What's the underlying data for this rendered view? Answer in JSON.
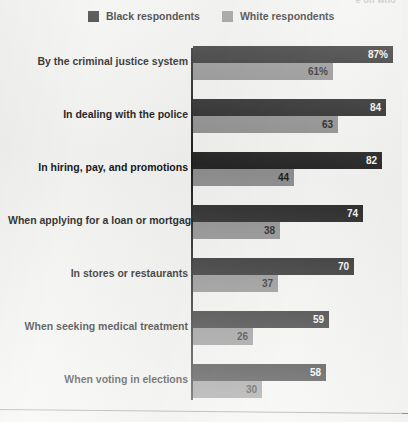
{
  "headline_fragment": "e on who",
  "legend": {
    "entries": [
      {
        "label": "Black respondents",
        "color": "#262626",
        "swatch": "legend-swatch-black"
      },
      {
        "label": "White respondents",
        "color": "#8e8e8e",
        "swatch": "legend-swatch-white"
      }
    ]
  },
  "chart_data": {
    "type": "bar",
    "orientation": "horizontal",
    "title": "",
    "subtitle": "",
    "xlabel": "",
    "ylabel": "",
    "xlim": [
      0,
      87
    ],
    "grid": false,
    "legend_position": "top",
    "value_suffix_first_row_only": "%",
    "categories": [
      "By the criminal justice system",
      "In dealing with the police",
      "In hiring, pay, and promotions",
      "When applying for a loan or mortgage",
      "In stores or restaurants",
      "When seeking medical treatment",
      "When voting in elections"
    ],
    "series": [
      {
        "name": "Black respondents",
        "color": "#262626",
        "values": [
          87,
          84,
          82,
          74,
          70,
          59,
          58
        ],
        "labels": [
          "87%",
          "84",
          "82",
          "74",
          "70",
          "59",
          "58"
        ]
      },
      {
        "name": "White respondents",
        "color": "#8e8e8e",
        "values": [
          61,
          63,
          44,
          38,
          37,
          26,
          30
        ],
        "labels": [
          "61%",
          "63",
          "44",
          "38",
          "37",
          "26",
          "30"
        ]
      }
    ]
  }
}
